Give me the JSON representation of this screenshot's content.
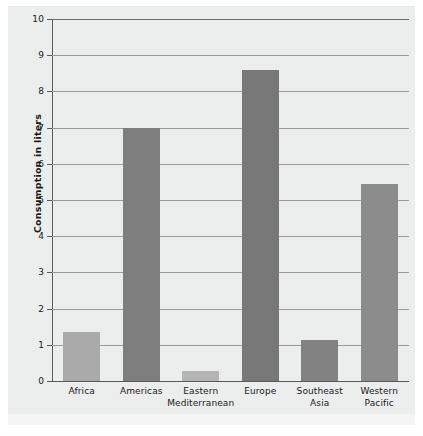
{
  "chart_data": {
    "type": "bar",
    "title": "",
    "subtitle": "",
    "xlabel": "",
    "ylabel": "Consumption in liters",
    "ylim": [
      0,
      10
    ],
    "ytick_step": 1,
    "grid": true,
    "legend": "none",
    "categories": [
      "Africa",
      "Eastern\nMediterranean",
      "Americas",
      "Europe",
      "Southeast\nAsia",
      "Western\nPacific"
    ],
    "category_lines": [
      [
        "Africa"
      ],
      [
        "Americas"
      ],
      [
        "Eastern",
        "Mediterranean"
      ],
      [
        "Europe"
      ],
      [
        "Southeast",
        "Asia"
      ],
      [
        "Western",
        "Pacific"
      ]
    ],
    "values": [
      1.35,
      7.0,
      0.28,
      8.6,
      1.13,
      5.45
    ],
    "bar_colors": [
      "#aaaaaa",
      "#7e7e7e",
      "#b4b4b4",
      "#787878",
      "#828282",
      "#8c8c8c"
    ],
    "ytick_labels": [
      "10",
      "9",
      "8",
      "7",
      "6",
      "5",
      "4",
      "3",
      "2",
      "1",
      "0"
    ],
    "ytick_values": [
      10,
      9,
      8,
      7,
      6,
      5,
      4,
      3,
      2,
      1,
      0
    ],
    "bars": [
      {
        "label": "Africa",
        "value": 1.35,
        "color": "#aaaaaa"
      },
      {
        "label": "Americas",
        "value": 7.0,
        "color": "#7e7e7e"
      },
      {
        "label": "Eastern Mediterranean",
        "value": 0.28,
        "color": "#b4b4b4"
      },
      {
        "label": "Europe",
        "value": 8.6,
        "color": "#787878"
      },
      {
        "label": "Southeast Asia",
        "value": 1.13,
        "color": "#828282"
      },
      {
        "label": "Western Pacific",
        "value": 5.45,
        "color": "#8c8c8c"
      }
    ]
  },
  "colors": {
    "panel_background": "#eceded",
    "gridline": "#9a9a9a",
    "axis": "#5a5a5a",
    "text": "#1a1a1a"
  }
}
